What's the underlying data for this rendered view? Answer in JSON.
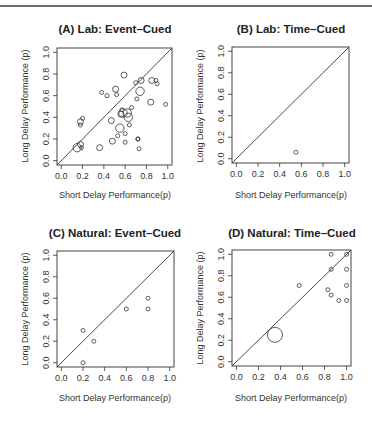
{
  "figure": {
    "top_rule": true
  },
  "chart_data": [
    {
      "id": "A",
      "type": "scatter",
      "title": "(A) Lab: Event–Cued",
      "xlabel": "Short Delay Performance(p)",
      "ylabel": "Long Delay Performance (p)",
      "xlim": [
        0,
        1
      ],
      "ylim": [
        0,
        1
      ],
      "xticks": [
        "0.0",
        "0.2",
        "0.4",
        "0.6",
        "0.8",
        "1.0"
      ],
      "yticks": [
        "0.0",
        "0.2",
        "0.4",
        "0.6",
        "0.8",
        "1.0"
      ],
      "reference_line": "y = x",
      "grid": false,
      "points": [
        {
          "x": 0.15,
          "y": 0.12,
          "size": "large"
        },
        {
          "x": 0.18,
          "y": 0.15,
          "size": "medium"
        },
        {
          "x": 0.19,
          "y": 0.12,
          "size": "small"
        },
        {
          "x": 0.18,
          "y": 0.33,
          "size": "small"
        },
        {
          "x": 0.18,
          "y": 0.36,
          "size": "medium"
        },
        {
          "x": 0.2,
          "y": 0.39,
          "size": "small"
        },
        {
          "x": 0.36,
          "y": 0.12,
          "size": "medium"
        },
        {
          "x": 0.38,
          "y": 0.63,
          "size": "small"
        },
        {
          "x": 0.43,
          "y": 0.6,
          "size": "small"
        },
        {
          "x": 0.47,
          "y": 0.37,
          "size": "medium"
        },
        {
          "x": 0.48,
          "y": 0.18,
          "size": "medium"
        },
        {
          "x": 0.51,
          "y": 0.66,
          "size": "medium"
        },
        {
          "x": 0.52,
          "y": 0.61,
          "size": "small"
        },
        {
          "x": 0.53,
          "y": 0.23,
          "size": "small"
        },
        {
          "x": 0.55,
          "y": 0.3,
          "size": "large"
        },
        {
          "x": 0.56,
          "y": 0.43,
          "size": "medium"
        },
        {
          "x": 0.57,
          "y": 0.47,
          "size": "small"
        },
        {
          "x": 0.58,
          "y": 0.44,
          "size": "large"
        },
        {
          "x": 0.59,
          "y": 0.79,
          "size": "medium"
        },
        {
          "x": 0.6,
          "y": 0.25,
          "size": "small"
        },
        {
          "x": 0.6,
          "y": 0.17,
          "size": "small"
        },
        {
          "x": 0.62,
          "y": 0.44,
          "size": "large"
        },
        {
          "x": 0.63,
          "y": 0.4,
          "size": "large"
        },
        {
          "x": 0.64,
          "y": 0.33,
          "size": "small"
        },
        {
          "x": 0.66,
          "y": 0.49,
          "size": "small"
        },
        {
          "x": 0.7,
          "y": 0.72,
          "size": "small"
        },
        {
          "x": 0.71,
          "y": 0.57,
          "size": "small"
        },
        {
          "x": 0.72,
          "y": 0.2,
          "size": "small"
        },
        {
          "x": 0.72,
          "y": 0.2,
          "size": "small"
        },
        {
          "x": 0.73,
          "y": 0.11,
          "size": "small"
        },
        {
          "x": 0.74,
          "y": 0.64,
          "size": "large"
        },
        {
          "x": 0.75,
          "y": 0.74,
          "size": "medium"
        },
        {
          "x": 0.84,
          "y": 0.54,
          "size": "medium"
        },
        {
          "x": 0.85,
          "y": 0.74,
          "size": "medium"
        },
        {
          "x": 0.89,
          "y": 0.74,
          "size": "small"
        },
        {
          "x": 0.9,
          "y": 0.71,
          "size": "small"
        },
        {
          "x": 0.98,
          "y": 0.52,
          "size": "small"
        }
      ]
    },
    {
      "id": "B",
      "type": "scatter",
      "title": "(B) Lab: Time–Cued",
      "xlabel": "Short Delay Performance(p)",
      "ylabel": "Long Delay Performance (p)",
      "xlim": [
        0,
        1
      ],
      "ylim": [
        0,
        1
      ],
      "xticks": [
        "0.0",
        "0.2",
        "0.4",
        "0.6",
        "0.8",
        "1.0"
      ],
      "yticks": [
        "0.0",
        "0.2",
        "0.4",
        "0.6",
        "0.8",
        "1.0"
      ],
      "reference_line": "y = x",
      "grid": false,
      "points": [
        {
          "x": 0.55,
          "y": 0.06,
          "size": "small"
        }
      ]
    },
    {
      "id": "C",
      "type": "scatter",
      "title": "(C) Natural: Event–Cued",
      "xlabel": "Short Delay Performance(p)",
      "ylabel": "Long Delay Performance (p)",
      "xlim": [
        0,
        1
      ],
      "ylim": [
        0,
        1
      ],
      "xticks": [
        "0.0",
        "0.2",
        "0.4",
        "0.6",
        "0.8",
        "1.0"
      ],
      "yticks": [
        "0.0",
        "0.2",
        "0.4",
        "0.6",
        "0.8",
        "1.0"
      ],
      "reference_line": "y = x",
      "grid": false,
      "points": [
        {
          "x": 0.2,
          "y": 0.3,
          "size": "small"
        },
        {
          "x": 0.2,
          "y": 0.0,
          "size": "small"
        },
        {
          "x": 0.3,
          "y": 0.2,
          "size": "small"
        },
        {
          "x": 0.6,
          "y": 0.5,
          "size": "small"
        },
        {
          "x": 0.8,
          "y": 0.6,
          "size": "small"
        },
        {
          "x": 0.8,
          "y": 0.5,
          "size": "small"
        }
      ]
    },
    {
      "id": "D",
      "type": "scatter",
      "title": "(D) Natural: Time–Cued",
      "xlabel": "Short Delay Performance(p)",
      "ylabel": "Long Delay Performance (p)",
      "xlim": [
        0,
        1
      ],
      "ylim": [
        0,
        1
      ],
      "xticks": [
        "0.0",
        "0.2",
        "0.4",
        "0.6",
        "0.8",
        "1.0"
      ],
      "yticks": [
        "0.0",
        "0.2",
        "0.4",
        "0.6",
        "0.8",
        "1.0"
      ],
      "reference_line": "y = x",
      "grid": false,
      "points": [
        {
          "x": 0.35,
          "y": 0.25,
          "size": "xlarge"
        },
        {
          "x": 0.57,
          "y": 0.71,
          "size": "small"
        },
        {
          "x": 0.83,
          "y": 0.67,
          "size": "small"
        },
        {
          "x": 0.86,
          "y": 1.0,
          "size": "small"
        },
        {
          "x": 0.86,
          "y": 0.86,
          "size": "small"
        },
        {
          "x": 0.86,
          "y": 0.62,
          "size": "small"
        },
        {
          "x": 0.93,
          "y": 0.57,
          "size": "small"
        },
        {
          "x": 1.0,
          "y": 1.0,
          "size": "small"
        },
        {
          "x": 1.0,
          "y": 0.86,
          "size": "small"
        },
        {
          "x": 1.0,
          "y": 0.71,
          "size": "small"
        },
        {
          "x": 1.0,
          "y": 0.57,
          "size": "small"
        }
      ]
    }
  ],
  "panels": [
    {
      "title": "(A) Lab: Event–Cued",
      "xlabel": "Short Delay Performance(p)",
      "ylabel": "Long Delay Performance (p)"
    },
    {
      "title": "(B) Lab: Time–Cued",
      "xlabel": "Short Delay Performance(p)",
      "ylabel": "Long Delay Performance (p)"
    },
    {
      "title": "(C) Natural: Event–Cued",
      "xlabel": "Short Delay Performance(p)",
      "ylabel": "Long Delay Performance (p)"
    },
    {
      "title": "(D) Natural: Time–Cued",
      "xlabel": "Short Delay Performance(p)",
      "ylabel": "Long Delay Performance (p)"
    }
  ],
  "style": {
    "ink": "#333333",
    "frame": "#444444",
    "rule": "#6b6b6b"
  }
}
